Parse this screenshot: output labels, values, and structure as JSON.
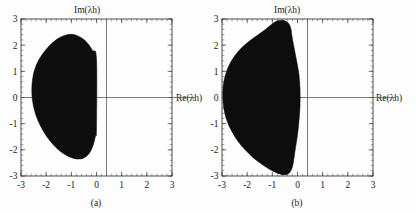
{
  "figure": {
    "background_color": "#fdfdfd",
    "panel_count": 2
  },
  "chart_data": [
    {
      "type": "area",
      "panel_id": "a",
      "caption": "(a)",
      "title": "",
      "xlabel": "Re(λh)",
      "ylabel": "Im(λh)",
      "xlim": [
        -3,
        3
      ],
      "ylim": [
        -3,
        3
      ],
      "xticks": [
        -3,
        -2,
        -1,
        0,
        1,
        2,
        3
      ],
      "yticks": [
        -3,
        -2,
        -1,
        0,
        1,
        2,
        3
      ],
      "xticklabels": [
        "-3",
        "-2",
        "-1",
        "0",
        "1",
        "2",
        "3"
      ],
      "yticklabels": [
        "-3",
        "-2",
        "-1",
        "0",
        "1",
        "2",
        "3"
      ],
      "grid": false,
      "legend": null,
      "minor_ticks_per_interval": 5,
      "series": [
        {
          "name": "stability region",
          "fill_color": "#0d0d0d",
          "description": "Filled closed region of absolute stability, lens/egg shaped, lying entirely in the left half plane with its right boundary on Re=0.",
          "boundary": [
            [
              0.0,
              1.48
            ],
            [
              -0.16,
              1.8
            ],
            [
              -0.36,
              2.08
            ],
            [
              -0.6,
              2.28
            ],
            [
              -0.88,
              2.4
            ],
            [
              -1.16,
              2.4
            ],
            [
              -1.44,
              2.3
            ],
            [
              -1.74,
              2.1
            ],
            [
              -2.02,
              1.82
            ],
            [
              -2.28,
              1.46
            ],
            [
              -2.46,
              1.06
            ],
            [
              -2.55,
              0.62
            ],
            [
              -2.57,
              0.18
            ],
            [
              -2.52,
              -0.26
            ],
            [
              -2.4,
              -0.7
            ],
            [
              -2.22,
              -1.1
            ],
            [
              -2.0,
              -1.46
            ],
            [
              -1.74,
              -1.78
            ],
            [
              -1.46,
              -2.04
            ],
            [
              -1.18,
              -2.22
            ],
            [
              -0.9,
              -2.33
            ],
            [
              -0.64,
              -2.35
            ],
            [
              -0.42,
              -2.26
            ],
            [
              -0.24,
              -2.06
            ],
            [
              -0.12,
              -1.78
            ],
            [
              -0.04,
              -1.46
            ],
            [
              0.0,
              -1.18
            ],
            [
              0.0,
              1.48
            ]
          ],
          "extent": {
            "re_min": -2.57,
            "re_max": 0.0,
            "im_min": -2.35,
            "im_max": 2.4
          }
        }
      ]
    },
    {
      "type": "area",
      "panel_id": "b",
      "caption": "(b)",
      "title": "",
      "xlabel": "Re(λh)",
      "ylabel": "Im(λh)",
      "xlim": [
        -3,
        3
      ],
      "ylim": [
        -3,
        3
      ],
      "xticks": [
        -3,
        -2,
        -1,
        0,
        1,
        2,
        3
      ],
      "yticks": [
        -3,
        -2,
        -1,
        0,
        1,
        2,
        3
      ],
      "xticklabels": [
        "-3",
        "-2",
        "-1",
        "0",
        "1",
        "2",
        "3"
      ],
      "yticklabels": [
        "-3",
        "-2",
        "-1",
        "0",
        "1",
        "2",
        "3"
      ],
      "grid": false,
      "legend": null,
      "minor_ticks_per_interval": 5,
      "series": [
        {
          "name": "stability region",
          "fill_color": "#0d0d0d",
          "description": "Larger filled closed region of absolute stability, crescent/kidney shaped, spanning Re from about -3 to slightly past 0, with rounded lobes near Im=+2.7 and Im=-2.7 and a waist pinch near Im=0.",
          "boundary": [
            [
              0.1,
              0.3
            ],
            [
              0.06,
              0.86
            ],
            [
              -0.04,
              1.42
            ],
            [
              -0.14,
              1.92
            ],
            [
              -0.22,
              2.34
            ],
            [
              -0.26,
              2.62
            ],
            [
              -0.36,
              2.84
            ],
            [
              -0.56,
              2.95
            ],
            [
              -0.8,
              2.93
            ],
            [
              -1.02,
              2.8
            ],
            [
              -1.3,
              2.58
            ],
            [
              -1.62,
              2.36
            ],
            [
              -1.96,
              2.12
            ],
            [
              -2.28,
              1.84
            ],
            [
              -2.56,
              1.5
            ],
            [
              -2.78,
              1.1
            ],
            [
              -2.92,
              0.64
            ],
            [
              -2.97,
              0.16
            ],
            [
              -2.94,
              -0.34
            ],
            [
              -2.82,
              -0.84
            ],
            [
              -2.62,
              -1.28
            ],
            [
              -2.36,
              -1.68
            ],
            [
              -2.06,
              -2.02
            ],
            [
              -1.76,
              -2.3
            ],
            [
              -1.46,
              -2.52
            ],
            [
              -1.18,
              -2.7
            ],
            [
              -0.92,
              -2.84
            ],
            [
              -0.68,
              -2.93
            ],
            [
              -0.46,
              -2.95
            ],
            [
              -0.3,
              -2.86
            ],
            [
              -0.2,
              -2.64
            ],
            [
              -0.14,
              -2.32
            ],
            [
              -0.08,
              -1.92
            ],
            [
              0.0,
              -1.42
            ],
            [
              0.06,
              -0.88
            ],
            [
              0.1,
              -0.3
            ],
            [
              0.1,
              0.3
            ]
          ],
          "extent": {
            "re_min": -2.97,
            "re_max": 0.1,
            "im_min": -2.95,
            "im_max": 2.95
          }
        }
      ]
    }
  ],
  "panels": [
    {
      "id": "a",
      "caption": "(a)",
      "ylabel": "Im(λh)",
      "xlabel": "Re(λh)",
      "xticklabels": [
        "-3",
        "-2",
        "-1",
        "0",
        "1",
        "2",
        "3"
      ],
      "yticklabels": [
        "3",
        "2",
        "1",
        "0",
        "-1",
        "-2",
        "-3"
      ]
    },
    {
      "id": "b",
      "caption": "(b)",
      "ylabel": "Im(λh)",
      "xlabel": "Re(λh)",
      "xticklabels": [
        "-3",
        "-2",
        "-1",
        "0",
        "1",
        "2",
        "3"
      ],
      "yticklabels": [
        "3",
        "2",
        "1",
        "0",
        "-1",
        "-2",
        "-3"
      ]
    }
  ],
  "colors": {
    "region_fill": "#0d0d0d",
    "frame": "#3a3a3a",
    "axis_line": "#5a5a5a",
    "text": "#1b1b1b",
    "background": "#fdfdfd"
  }
}
